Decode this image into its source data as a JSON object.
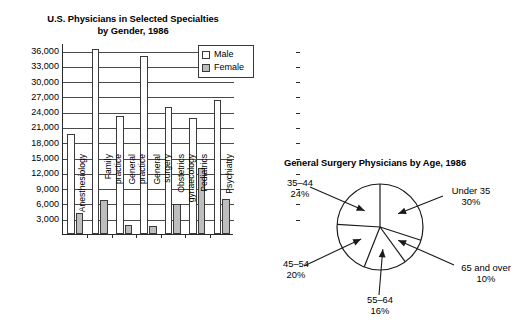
{
  "bar_chart": {
    "title_line1": "U.S. Physicians in Selected Specialties",
    "title_line2": "by Gender, 1986",
    "legend": [
      {
        "label": "Male",
        "color": "#ffffff"
      },
      {
        "label": "Female",
        "color": "#bdbdbd"
      }
    ],
    "y_ticks": [
      "36,000",
      "33,000",
      "30,000",
      "27,000",
      "24,000",
      "21,000",
      "18,000",
      "15,000",
      "12,000",
      "9,000",
      "6,000",
      "3,000"
    ],
    "categories": [
      {
        "line1": "Anesthesiology",
        "line2": ""
      },
      {
        "line1": "Family",
        "line2": "practice"
      },
      {
        "line1": "General",
        "line2": "practice"
      },
      {
        "line1": "General",
        "line2": "surgery"
      },
      {
        "line1": "Obstetrics",
        "line2": "gynaecology"
      },
      {
        "line1": "Pediatrics",
        "line2": ""
      },
      {
        "line1": "Psychiatry",
        "line2": ""
      }
    ]
  },
  "chart_data": [
    {
      "type": "bar",
      "title": "U.S. Physicians in Selected Specialties by Gender, 1986",
      "xlabel": "",
      "ylabel": "",
      "ylim": [
        0,
        37500
      ],
      "ytick_values": [
        3000,
        6000,
        9000,
        12000,
        15000,
        18000,
        21000,
        24000,
        27000,
        30000,
        33000,
        36000
      ],
      "grid": true,
      "legend_position": "top-right",
      "categories": [
        "Anesthesiology",
        "Family practice",
        "General practice",
        "General surgery",
        "Obstetrics gynaecology",
        "Pediatrics",
        "Psychiatry"
      ],
      "series": [
        {
          "name": "Male",
          "color": "#ffffff",
          "values": [
            19700,
            36300,
            23100,
            34900,
            25000,
            22700,
            26300
          ]
        },
        {
          "name": "Female",
          "color": "#bdbdbd",
          "values": [
            4200,
            6700,
            1700,
            1600,
            5800,
            13000,
            6800
          ]
        }
      ]
    },
    {
      "type": "pie",
      "title": "General Surgery Physicians by Age, 1986",
      "labels": [
        "Under 35",
        "65 and over",
        "55–64",
        "45–54",
        "35–44"
      ],
      "values": [
        30,
        10,
        16,
        20,
        24
      ],
      "unit": "%",
      "legend_position": "callout-labels",
      "start_angle_deg": 0,
      "direction": "clockwise"
    }
  ],
  "pie_chart": {
    "title": "General Surgery Physicians by Age, 1986",
    "slices": [
      {
        "name": "Under 35",
        "pct": "30%",
        "value": 30
      },
      {
        "name": "65 and over",
        "pct": "10%",
        "value": 10
      },
      {
        "name": "55–64",
        "pct": "16%",
        "value": 16
      },
      {
        "name": "45–54",
        "pct": "20%",
        "value": 20
      },
      {
        "name": "35–44",
        "pct": "24%",
        "value": 24
      }
    ]
  }
}
